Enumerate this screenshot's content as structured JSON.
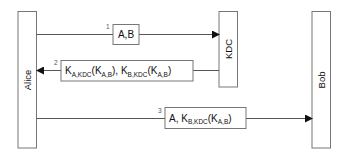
{
  "diagram": {
    "type": "sequence",
    "colors": {
      "line": "#555555",
      "box": "#777777",
      "text": "#111111",
      "background": "#ffffff"
    },
    "actors": [
      {
        "id": "alice",
        "label": "Alice"
      },
      {
        "id": "kdc",
        "label": "KDC"
      },
      {
        "id": "bob",
        "label": "Bob"
      }
    ],
    "messages": [
      {
        "step": "1",
        "from": "Alice",
        "to": "KDC",
        "parts": [
          {
            "t": "A,B"
          }
        ]
      },
      {
        "step": "2",
        "from": "KDC",
        "to": "Alice",
        "parts": [
          {
            "t": "K"
          },
          {
            "sub": "A,KDC"
          },
          {
            "t": "(K"
          },
          {
            "sub": "A,B"
          },
          {
            "t": "), K"
          },
          {
            "sub": "B,KDC"
          },
          {
            "t": "(K"
          },
          {
            "sub": "A,B"
          },
          {
            "t": ")"
          }
        ]
      },
      {
        "step": "3",
        "from": "Alice",
        "to": "Bob",
        "parts": [
          {
            "t": "A, K"
          },
          {
            "sub": "B,KDC"
          },
          {
            "t": "(K"
          },
          {
            "sub": "A,B"
          },
          {
            "t": ")"
          }
        ]
      }
    ]
  }
}
